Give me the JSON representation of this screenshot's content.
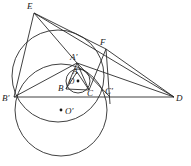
{
  "figure": {
    "width": 191,
    "height": 166,
    "background": "#ffffff",
    "stroke_color": "#2b2b2b",
    "label_color": "#1a1a1a"
  },
  "points": [
    {
      "id": "E",
      "label": "E",
      "x": 34,
      "y": 13,
      "lx": 27,
      "ly": 9,
      "marked": false
    },
    {
      "id": "F",
      "label": "F",
      "x": 106,
      "y": 49,
      "lx": 100,
      "ly": 45,
      "marked": false
    },
    {
      "id": "Ap",
      "label": "A′",
      "x": 77,
      "y": 63,
      "lx": 72,
      "ly": 60,
      "marked": false
    },
    {
      "id": "A",
      "label": "A",
      "x": 77,
      "y": 72,
      "lx": 73,
      "ly": 73,
      "marked": false
    },
    {
      "id": "B",
      "label": "B",
      "x": 66,
      "y": 89,
      "lx": 59,
      "ly": 91,
      "marked": false
    },
    {
      "id": "C",
      "label": "C",
      "x": 89,
      "y": 90,
      "lx": 88,
      "ly": 95,
      "marked": false
    },
    {
      "id": "Bp",
      "label": "B′",
      "x": 14,
      "y": 97,
      "lx": 3,
      "ly": 101,
      "marked": false
    },
    {
      "id": "Cp",
      "label": "C′",
      "x": 110,
      "y": 97,
      "lx": 106,
      "ly": 94,
      "marked": false
    },
    {
      "id": "D",
      "label": "D",
      "x": 174,
      "y": 97,
      "lx": 175,
      "ly": 101,
      "marked": false
    },
    {
      "id": "O",
      "label": "O",
      "x": 78,
      "y": 81,
      "lx": 69,
      "ly": 84,
      "marked": true
    },
    {
      "id": "Op",
      "label": "O′",
      "x": 61,
      "y": 110,
      "lx": 64,
      "ly": 114,
      "marked": true
    }
  ],
  "circles": [
    {
      "name": "incircle",
      "cx": 78,
      "cy": 81,
      "r": 12
    },
    {
      "name": "circumcircle-ABprimeCprime",
      "cx": 58,
      "cy": 76,
      "r": 46
    },
    {
      "name": "tangent-circle-O-prime",
      "cx": 61,
      "cy": 110,
      "r": 46
    }
  ],
  "segments": [
    {
      "name": "base-line-BprimeD",
      "from": "Bp",
      "to": "D"
    },
    {
      "name": "E-to-Bprime",
      "from": "E",
      "to": "Bp"
    },
    {
      "name": "E-to-Aprime",
      "from": "E",
      "to": "Ap"
    },
    {
      "name": "E-to-F",
      "from": "E",
      "to": "F"
    },
    {
      "name": "E-to-D",
      "from": "E",
      "to": "D"
    },
    {
      "name": "F-to-D",
      "from": "F",
      "to": "D"
    },
    {
      "name": "F-to-Cprime",
      "from": "F",
      "to": "Cp"
    },
    {
      "name": "F-to-C",
      "from": "F",
      "to": "C"
    },
    {
      "name": "Aprime-to-D",
      "from": "Ap",
      "to": "D"
    },
    {
      "name": "Aprime-to-Bprime",
      "from": "Ap",
      "to": "Bp"
    },
    {
      "name": "Aprime-to-Cprime",
      "from": "Ap",
      "to": "Cp"
    },
    {
      "name": "Aprime-to-B",
      "from": "Ap",
      "to": "B"
    },
    {
      "name": "Aprime-to-C",
      "from": "Ap",
      "to": "C"
    },
    {
      "name": "A-to-B",
      "from": "A",
      "to": "B"
    },
    {
      "name": "A-to-C",
      "from": "A",
      "to": "C"
    },
    {
      "name": "B-to-C",
      "from": "B",
      "to": "C"
    }
  ]
}
